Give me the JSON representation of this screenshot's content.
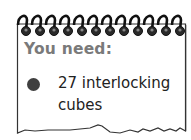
{
  "card": {
    "heading": "You need:",
    "items": [
      {
        "bullet_icon": "filled-circle-icon",
        "text_line1": "27 interlocking",
        "text_line2": "cubes"
      }
    ],
    "ring_count": 11,
    "colors": {
      "heading": "#7a7a7a",
      "bullet": "#3f3f3f",
      "text": "#222222",
      "border": "#333333"
    }
  }
}
